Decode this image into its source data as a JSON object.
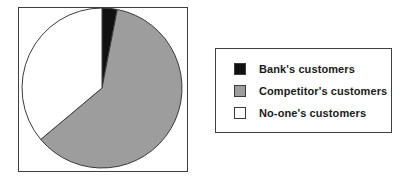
{
  "chart_data": {
    "type": "pie",
    "title": "",
    "categories": [
      "Bank's customers",
      "Competitor's customers",
      "No-one's customers"
    ],
    "values": [
      3,
      61,
      36
    ],
    "colors": [
      "#111111",
      "#9d9d9d",
      "#ffffff"
    ],
    "start_angle_deg": 0,
    "direction": "clockwise",
    "legend_position": "right",
    "grid": false,
    "slices": [
      {
        "label": "Bank's customers",
        "value": 3,
        "color": "#111111",
        "start_deg": 0,
        "end_deg": 11
      },
      {
        "label": "Competitor's customers",
        "value": 61,
        "color": "#9d9d9d",
        "start_deg": 11,
        "end_deg": 230
      },
      {
        "label": "No-one's customers",
        "value": 36,
        "color": "#ffffff",
        "start_deg": 230,
        "end_deg": 360
      }
    ]
  },
  "chart": {
    "border_color": "#3f3f3f",
    "background": "#ffffff",
    "center_x": 84,
    "center_y": 81,
    "radius": 80
  },
  "legend": {
    "border_color": "#3f3f3f",
    "background": "#ffffff",
    "items": [
      {
        "label": "Bank's customers",
        "color": "#111111",
        "swatch": "black-swatch"
      },
      {
        "label": "Competitor's customers",
        "color": "#9d9d9d",
        "swatch": "gray-swatch"
      },
      {
        "label": "No-one's customers",
        "color": "#ffffff",
        "swatch": "white-swatch"
      }
    ]
  }
}
